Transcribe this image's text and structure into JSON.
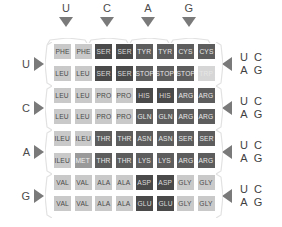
{
  "figure": {
    "name": "genetic-code-table",
    "first_base_axis": {
      "position": "top",
      "labels": [
        "U",
        "C",
        "A",
        "G"
      ],
      "arrow_icon": "triangle-down-icon"
    },
    "second_base_axis": {
      "position": "left",
      "labels": [
        "U",
        "C",
        "A",
        "G"
      ],
      "arrow_icon": "triangle-right-icon"
    },
    "third_base_axis": {
      "position": "right",
      "arrow_icon": "triangle-left-icon",
      "groups": [
        {
          "top_left": "U",
          "top_right": "C",
          "bottom_left": "A",
          "bottom_right": "G"
        },
        {
          "top_left": "U",
          "top_right": "C",
          "bottom_left": "A",
          "bottom_right": "G"
        },
        {
          "top_left": "U",
          "top_right": "C",
          "bottom_left": "A",
          "bottom_right": "G"
        },
        {
          "top_left": "U",
          "top_right": "C",
          "bottom_left": "A",
          "bottom_right": "G"
        }
      ]
    }
  },
  "colors": {
    "light": "#c9c9c9",
    "mid": "#9a9a9a",
    "dark": "#5d5d5d",
    "darker": "#4a4a4a",
    "faint": "#d6d6d6",
    "arrow": "#7a7a7a",
    "brace": "#e2e2e2",
    "axis_text": "#4c4c4c"
  },
  "chart_data": {
    "type": "table",
    "xlabel": "First base",
    "ylabel": "Second base",
    "row_labels": [
      "U",
      "C",
      "A",
      "G"
    ],
    "col_labels": [
      "U",
      "C",
      "A",
      "G"
    ],
    "third_base_labels": [
      "U",
      "C",
      "A",
      "G"
    ],
    "grid": false,
    "legend": "none",
    "cells": [
      {
        "r": 0,
        "c": 0,
        "text": "PHE",
        "shade": "light"
      },
      {
        "r": 0,
        "c": 1,
        "text": "PHE",
        "shade": "light"
      },
      {
        "r": 0,
        "c": 2,
        "text": "SER",
        "shade": "darker"
      },
      {
        "r": 0,
        "c": 3,
        "text": "SER",
        "shade": "darker"
      },
      {
        "r": 0,
        "c": 4,
        "text": "TYR",
        "shade": "dark"
      },
      {
        "r": 0,
        "c": 5,
        "text": "TYR",
        "shade": "dark"
      },
      {
        "r": 0,
        "c": 6,
        "text": "CYS",
        "shade": "dark"
      },
      {
        "r": 0,
        "c": 7,
        "text": "CYS",
        "shade": "dark"
      },
      {
        "r": 1,
        "c": 0,
        "text": "LEU",
        "shade": "light"
      },
      {
        "r": 1,
        "c": 1,
        "text": "LEU",
        "shade": "light"
      },
      {
        "r": 1,
        "c": 2,
        "text": "SER",
        "shade": "darker"
      },
      {
        "r": 1,
        "c": 3,
        "text": "SER",
        "shade": "darker"
      },
      {
        "r": 1,
        "c": 4,
        "text": "STOP",
        "shade": "dark"
      },
      {
        "r": 1,
        "c": 5,
        "text": "STOP",
        "shade": "dark"
      },
      {
        "r": 1,
        "c": 6,
        "text": "STOP",
        "shade": "dark"
      },
      {
        "r": 1,
        "c": 7,
        "text": "TRP",
        "shade": "faint"
      },
      {
        "r": 2,
        "c": 0,
        "text": "LEU",
        "shade": "light"
      },
      {
        "r": 2,
        "c": 1,
        "text": "LEU",
        "shade": "light"
      },
      {
        "r": 2,
        "c": 2,
        "text": "PRO",
        "shade": "light"
      },
      {
        "r": 2,
        "c": 3,
        "text": "PRO",
        "shade": "light"
      },
      {
        "r": 2,
        "c": 4,
        "text": "HIS",
        "shade": "darker"
      },
      {
        "r": 2,
        "c": 5,
        "text": "HIS",
        "shade": "darker"
      },
      {
        "r": 2,
        "c": 6,
        "text": "ARG",
        "shade": "dark"
      },
      {
        "r": 2,
        "c": 7,
        "text": "ARG",
        "shade": "dark"
      },
      {
        "r": 3,
        "c": 0,
        "text": "LEU",
        "shade": "light"
      },
      {
        "r": 3,
        "c": 1,
        "text": "LEU",
        "shade": "light"
      },
      {
        "r": 3,
        "c": 2,
        "text": "PRO",
        "shade": "light"
      },
      {
        "r": 3,
        "c": 3,
        "text": "PRO",
        "shade": "light"
      },
      {
        "r": 3,
        "c": 4,
        "text": "GLN",
        "shade": "dark"
      },
      {
        "r": 3,
        "c": 5,
        "text": "GLN",
        "shade": "dark"
      },
      {
        "r": 3,
        "c": 6,
        "text": "ARG",
        "shade": "dark"
      },
      {
        "r": 3,
        "c": 7,
        "text": "ARG",
        "shade": "dark"
      },
      {
        "r": 4,
        "c": 0,
        "text": "ILEU",
        "shade": "light"
      },
      {
        "r": 4,
        "c": 1,
        "text": "ILEU",
        "shade": "light"
      },
      {
        "r": 4,
        "c": 2,
        "text": "THR",
        "shade": "dark"
      },
      {
        "r": 4,
        "c": 3,
        "text": "THR",
        "shade": "dark"
      },
      {
        "r": 4,
        "c": 4,
        "text": "ASN",
        "shade": "dark"
      },
      {
        "r": 4,
        "c": 5,
        "text": "ASN",
        "shade": "dark"
      },
      {
        "r": 4,
        "c": 6,
        "text": "SER",
        "shade": "dark"
      },
      {
        "r": 4,
        "c": 7,
        "text": "SER",
        "shade": "dark"
      },
      {
        "r": 5,
        "c": 0,
        "text": "ILEU",
        "shade": "light"
      },
      {
        "r": 5,
        "c": 1,
        "text": "MET",
        "shade": "mid"
      },
      {
        "r": 5,
        "c": 2,
        "text": "THR",
        "shade": "dark"
      },
      {
        "r": 5,
        "c": 3,
        "text": "THR",
        "shade": "dark"
      },
      {
        "r": 5,
        "c": 4,
        "text": "LYS",
        "shade": "dark"
      },
      {
        "r": 5,
        "c": 5,
        "text": "LYS",
        "shade": "dark"
      },
      {
        "r": 5,
        "c": 6,
        "text": "ARG",
        "shade": "dark"
      },
      {
        "r": 5,
        "c": 7,
        "text": "ARG",
        "shade": "dark"
      },
      {
        "r": 6,
        "c": 0,
        "text": "VAL",
        "shade": "light"
      },
      {
        "r": 6,
        "c": 1,
        "text": "VAL",
        "shade": "light"
      },
      {
        "r": 6,
        "c": 2,
        "text": "ALA",
        "shade": "light"
      },
      {
        "r": 6,
        "c": 3,
        "text": "ALA",
        "shade": "light"
      },
      {
        "r": 6,
        "c": 4,
        "text": "ASP",
        "shade": "darker"
      },
      {
        "r": 6,
        "c": 5,
        "text": "ASP",
        "shade": "darker"
      },
      {
        "r": 6,
        "c": 6,
        "text": "GLY",
        "shade": "light"
      },
      {
        "r": 6,
        "c": 7,
        "text": "GLY",
        "shade": "light"
      },
      {
        "r": 7,
        "c": 0,
        "text": "VAL",
        "shade": "light"
      },
      {
        "r": 7,
        "c": 1,
        "text": "VAL",
        "shade": "light"
      },
      {
        "r": 7,
        "c": 2,
        "text": "ALA",
        "shade": "light"
      },
      {
        "r": 7,
        "c": 3,
        "text": "ALA",
        "shade": "light"
      },
      {
        "r": 7,
        "c": 4,
        "text": "GLU",
        "shade": "darker"
      },
      {
        "r": 7,
        "c": 5,
        "text": "GLU",
        "shade": "darker"
      },
      {
        "r": 7,
        "c": 6,
        "text": "GLY",
        "shade": "light"
      },
      {
        "r": 7,
        "c": 7,
        "text": "GLY",
        "shade": "light"
      }
    ]
  }
}
